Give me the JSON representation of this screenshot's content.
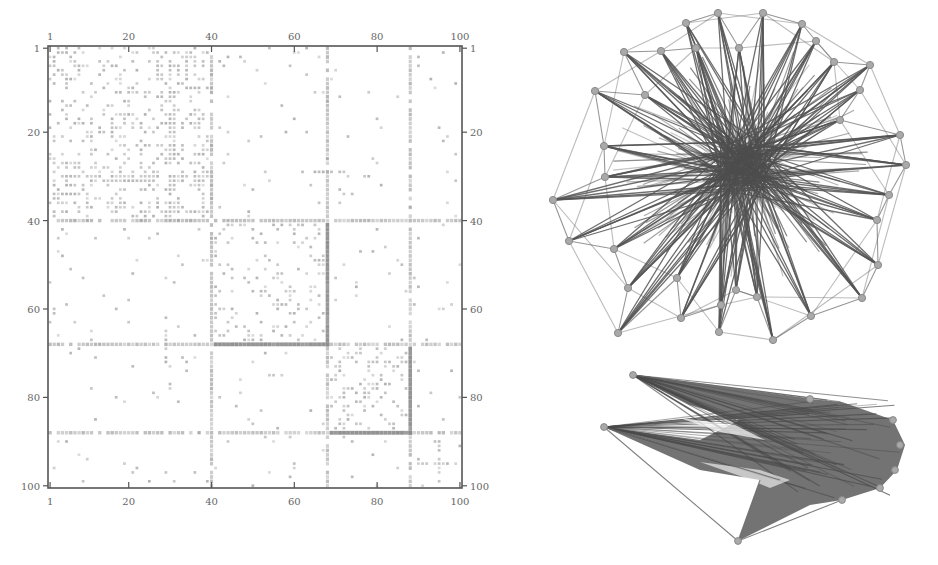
{
  "chart_data": [
    {
      "type": "heatmap",
      "title": "",
      "subtitle": "Adjacency matrix (100 x 100)",
      "xlabel": "",
      "ylabel": "",
      "x_ticks_top": [
        "1",
        "20",
        "40",
        "60",
        "80",
        "100"
      ],
      "x_ticks_bottom": [
        "1",
        "20",
        "40",
        "60",
        "80",
        "100"
      ],
      "y_ticks_left": [
        "1",
        "20",
        "40",
        "60",
        "80",
        "100"
      ],
      "y_ticks_right": [
        "1",
        "20",
        "40",
        "60",
        "80",
        "100"
      ],
      "xlim": [
        1,
        100
      ],
      "ylim": [
        1,
        100
      ],
      "grid": false,
      "legend": null,
      "hub_nodes": [
        40,
        68,
        88
      ],
      "dense_block": {
        "rows": [
          1,
          40
        ],
        "cols": [
          1,
          40
        ]
      },
      "description": "Sparse symmetric adjacency matrix; hub nodes 40, 68, 88 produce full horizontal and vertical lines; denser cluster in rows/cols 1-40 and 68-88 blocks."
    },
    {
      "type": "network",
      "title": "",
      "layout": "force-directed (hub-and-spoke)",
      "node_count_visible": 36,
      "description": "Radial network with dense central hub and peripheral nodes connected by outer ring edges."
    },
    {
      "type": "network",
      "title": "",
      "layout": "arrowhead / chevron projection",
      "node_count_visible": 9,
      "description": "Same network in alternative projection forming a chevron shape with dense edge fill toward the right apex."
    }
  ],
  "matrix": {
    "frame": {
      "x": 48,
      "y": 46,
      "w": 414,
      "h": 442
    },
    "n": 100,
    "ticks": [
      1,
      20,
      40,
      60,
      80,
      100
    ]
  },
  "network_top": {
    "hub": [
      743,
      165
    ],
    "nodes": [
      [
        718,
        13
      ],
      [
        763,
        13
      ],
      [
        686,
        23
      ],
      [
        802,
        24
      ],
      [
        624,
        52
      ],
      [
        661,
        51
      ],
      [
        816,
        41
      ],
      [
        696,
        48
      ],
      [
        739,
        48
      ],
      [
        595,
        91
      ],
      [
        834,
        62
      ],
      [
        870,
        65
      ],
      [
        860,
        90
      ],
      [
        900,
        135
      ],
      [
        604,
        146
      ],
      [
        906,
        165
      ],
      [
        553,
        200
      ],
      [
        605,
        177
      ],
      [
        889,
        195
      ],
      [
        569,
        241
      ],
      [
        614,
        249
      ],
      [
        877,
        220
      ],
      [
        878,
        265
      ],
      [
        628,
        288
      ],
      [
        677,
        278
      ],
      [
        811,
        316
      ],
      [
        862,
        298
      ],
      [
        721,
        305
      ],
      [
        681,
        318
      ],
      [
        719,
        332
      ],
      [
        757,
        297
      ],
      [
        618,
        333
      ],
      [
        773,
        340
      ],
      [
        736,
        290
      ],
      [
        645,
        95
      ],
      [
        840,
        120
      ]
    ]
  },
  "network_bottom": {
    "nodes": [
      [
        633,
        375
      ],
      [
        604,
        427
      ],
      [
        810,
        399
      ],
      [
        738,
        541
      ],
      [
        842,
        500
      ],
      [
        893,
        420
      ],
      [
        900,
        445
      ],
      [
        895,
        470
      ],
      [
        880,
        488
      ]
    ]
  }
}
